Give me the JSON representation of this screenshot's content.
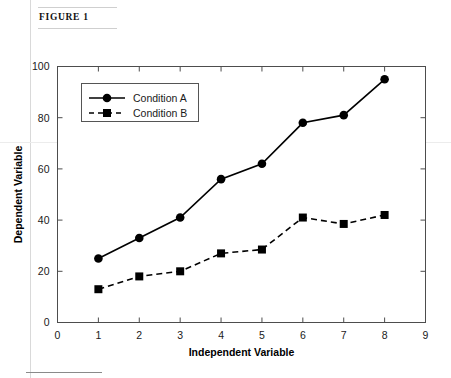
{
  "figure": {
    "header_label": "FIGURE 1"
  },
  "chart_data": {
    "type": "line",
    "title": "",
    "xlabel": "Independent Variable",
    "ylabel": "Dependent Variable",
    "x": [
      1,
      2,
      3,
      4,
      5,
      6,
      7,
      8
    ],
    "xlim": [
      0,
      9
    ],
    "ylim": [
      0,
      100
    ],
    "xticks": [
      0,
      1,
      2,
      3,
      4,
      5,
      6,
      7,
      8,
      9
    ],
    "yticks": [
      0,
      20,
      40,
      60,
      80,
      100
    ],
    "xtick_labels": [
      "0",
      "1",
      "2",
      "3",
      "4",
      "5",
      "6",
      "7",
      "8",
      "9"
    ],
    "ytick_labels": [
      "0",
      "20",
      "40",
      "60",
      "80",
      "100"
    ],
    "grid": false,
    "legend_position": "upper left",
    "series": [
      {
        "name": "Condition A",
        "values": [
          25,
          33,
          41,
          56,
          62,
          78,
          81,
          95
        ],
        "marker": "circle",
        "linestyle": "solid",
        "color": "#000000"
      },
      {
        "name": "Condition B",
        "values": [
          13,
          18,
          20,
          27,
          28.5,
          41,
          38.5,
          42
        ],
        "marker": "square",
        "linestyle": "dashed",
        "color": "#000000"
      }
    ]
  }
}
